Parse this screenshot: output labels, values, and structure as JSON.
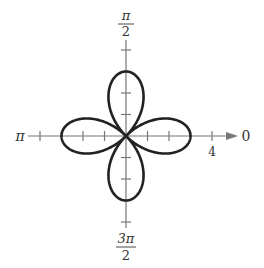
{
  "chart_data": {
    "type": "polar-line",
    "title": "",
    "equation": "r = 3cos(2θ)",
    "series": [
      {
        "name": "rose curve",
        "function": "3*cos(2*theta)",
        "petals": 4,
        "max_r": 3
      }
    ],
    "axes": {
      "angle_labels": {
        "right": "0",
        "top_num": "π",
        "top_den": "2",
        "left": "π",
        "bottom_num": "3π",
        "bottom_den": "2"
      },
      "r_tick_label": "4",
      "r_ticks": [
        1,
        2,
        3,
        4
      ],
      "r_range": [
        0,
        4
      ]
    },
    "grid": false,
    "legend": null
  }
}
